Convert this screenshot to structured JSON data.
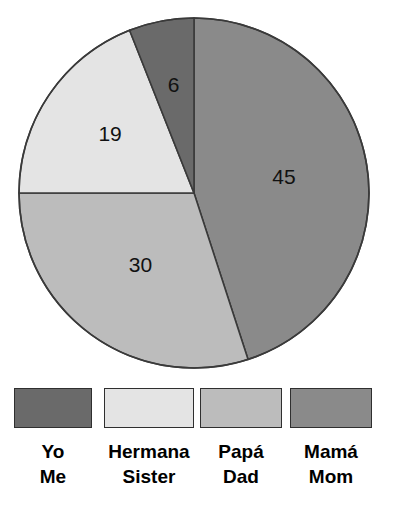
{
  "chart_data": {
    "type": "pie",
    "title": "",
    "labels": [
      "Mamá / Mom",
      "Papá / Dad",
      "Hermana / Sister",
      "Yo / Me"
    ],
    "values": [
      45,
      30,
      19,
      6
    ],
    "total": 100,
    "value_labels": [
      "45",
      "30",
      "19",
      "6"
    ],
    "colors": [
      "#8a8a8a",
      "#bcbcbc",
      "#e4e4e4",
      "#6a6a6a"
    ],
    "start_angle_deg": 0,
    "direction": "clockwise",
    "legend_position": "bottom",
    "grid": false,
    "slices": [
      {
        "value": 45,
        "value_label": "45",
        "label_es": "Mamá",
        "label_en": "Mom",
        "color": "#8a8a8a"
      },
      {
        "value": 30,
        "value_label": "30",
        "label_es": "Papá",
        "label_en": "Dad",
        "color": "#bcbcbc"
      },
      {
        "value": 19,
        "value_label": "19",
        "label_es": "Hermana",
        "label_en": "Sister",
        "color": "#e4e4e4"
      },
      {
        "value": 6,
        "value_label": "6",
        "label_es": "Yo",
        "label_en": "Me",
        "color": "#6a6a6a"
      }
    ]
  },
  "pie": {
    "center_x": 194,
    "center_y": 193,
    "radius": 175,
    "outline_color": "#3a3a3a",
    "value_text_color": "#111111",
    "slice_values": {
      "mom": "45",
      "dad": "30",
      "sister": "19",
      "me": "6"
    }
  },
  "legend": {
    "items": [
      {
        "label_es": "Yo",
        "label_en": "Me",
        "color": "#6a6a6a"
      },
      {
        "label_es": "Hermana",
        "label_en": "Sister",
        "color": "#e4e4e4"
      },
      {
        "label_es": "Papá",
        "label_en": "Dad",
        "color": "#bcbcbc"
      },
      {
        "label_es": "Mamá",
        "label_en": "Mom",
        "color": "#8a8a8a"
      }
    ]
  }
}
